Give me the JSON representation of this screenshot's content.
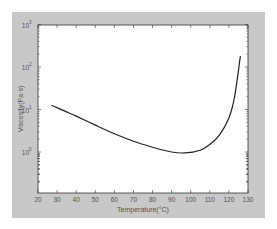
{
  "chart_data": {
    "type": "line",
    "title": "",
    "xlabel": "Temperature(°C)",
    "ylabel": "Viscosity(Pa·s)",
    "xlim": [
      20,
      130
    ],
    "ylim": [
      1,
      1000
    ],
    "yscale": "log",
    "grid": false,
    "x_ticks": [
      "20",
      "30",
      "40",
      "50",
      "60",
      "70",
      "80",
      "90",
      "100",
      "110",
      "120",
      "130"
    ],
    "y_ticks": [
      {
        "base": "10",
        "exp": "0",
        "value": 1
      },
      {
        "base": "10",
        "exp": "1",
        "value": 10
      },
      {
        "base": "10",
        "exp": "2",
        "value": 100
      },
      {
        "base": "10",
        "exp": "3",
        "value": 1000
      }
    ],
    "series": [
      {
        "name": "viscosity",
        "color": "#222222",
        "x": [
          27,
          35,
          40,
          50,
          60,
          70,
          80,
          90,
          97,
          105,
          110,
          115,
          120,
          123,
          126
        ],
        "values": [
          12.6,
          8.8,
          7.0,
          4.3,
          2.7,
          1.8,
          1.3,
          1.0,
          0.95,
          1.1,
          1.5,
          2.5,
          6.3,
          20,
          180
        ]
      }
    ]
  },
  "colors": {
    "frame_bg": "#c8c8c8",
    "plot_bg": "#ffffff",
    "axis": "#333333",
    "line": "#222222"
  }
}
